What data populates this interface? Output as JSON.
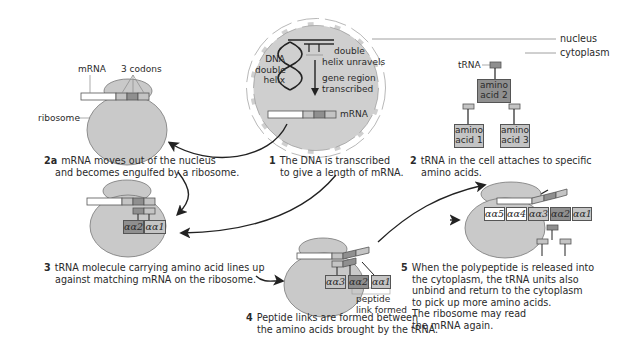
{
  "colors": {
    "ribosome": "#c9c9c9",
    "nucleus": "#cfcfcf",
    "codon_light": "#bdbdbd",
    "codon_dark": "#8c8c8c",
    "amino_dark": "#8f8f8f",
    "amino_light": "#c4c4c4",
    "mrna_white": "#ffffff",
    "stroke": "#444444"
  },
  "labels": {
    "nucleus": "nucleus",
    "cytoplasm": "cytoplasm",
    "mrna_top_left": "mRNA",
    "three_codons": "3 codons",
    "ribosome": "ribosome",
    "dna_double_helix": [
      "DNA",
      "double",
      "helix"
    ],
    "double_helix_unravels": [
      "double",
      "helix unravels"
    ],
    "gene_region_transcribed": [
      "gene region",
      "transcribed"
    ],
    "mrna_nucleus": "mRNA",
    "trna": "tRNA",
    "peptide_link_formed": [
      "peptide",
      "link formed"
    ]
  },
  "amino_acids_step2": {
    "aa2": [
      "amino",
      "acid 2"
    ],
    "aa1": [
      "amino",
      "acid 1"
    ],
    "aa3": [
      "amino",
      "acid 3"
    ]
  },
  "amino_chain": {
    "step3": [
      "αα2",
      "αα1"
    ],
    "step4": [
      "αα3",
      "αα2",
      "αα1"
    ],
    "step5": [
      "αα5",
      "αα4",
      "αα3",
      "αα2",
      "αα1"
    ]
  },
  "steps": [
    {
      "num": "1",
      "lines": [
        "The DNA is transcribed",
        "to give a length of mRNA."
      ]
    },
    {
      "num": "2a",
      "lines": [
        "mRNA moves out of the nucleus",
        "and becomes engulfed by a ribosome."
      ]
    },
    {
      "num": "2",
      "lines": [
        "tRNA in the cell attaches to specific",
        "amino acids."
      ]
    },
    {
      "num": "3",
      "lines": [
        "tRNA molecule carrying amino acid lines up",
        "against matching mRNA on the ribosome."
      ]
    },
    {
      "num": "4",
      "lines": [
        "Peptide links are formed between",
        "the amino acids brought by the tRNA."
      ]
    },
    {
      "num": "5",
      "lines": [
        "When the polypeptide is released into",
        "the cytoplasm, the tRNA units also",
        "unbind and return to the cytoplasm",
        "to pick up more amino acids.",
        "The ribosome may read",
        "the mRNA again."
      ]
    }
  ]
}
